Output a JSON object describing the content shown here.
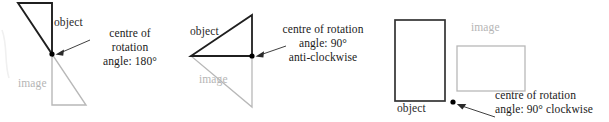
{
  "figures": [
    {
      "id": "figure-1",
      "object_label": "object",
      "image_label": "image",
      "note_lines": [
        "centre of",
        "rotation",
        "angle: 180°"
      ],
      "shape": "triangle",
      "object_color": "#111111",
      "image_color": "#b8b8b8",
      "centre_dot_color": "#000000",
      "rotation_angle": "180°",
      "rotation_direction": ""
    },
    {
      "id": "figure-2",
      "object_label": "object",
      "image_label": "image",
      "note_lines": [
        "centre of rotation",
        "angle: 90°",
        "anti-clockwise"
      ],
      "shape": "triangle",
      "object_color": "#111111",
      "image_color": "#b8b8b8",
      "centre_dot_color": "#000000",
      "rotation_angle": "90°",
      "rotation_direction": "anti-clockwise"
    },
    {
      "id": "figure-3",
      "object_label": "object",
      "image_label": "image",
      "note_lines": [
        "centre of rotation",
        "angle: 90° clockwise"
      ],
      "shape": "rectangle",
      "object_color": "#333333",
      "image_color": "#b8b8b8",
      "centre_dot_color": "#000000",
      "rotation_angle": "90°",
      "rotation_direction": "clockwise"
    }
  ],
  "colors": {
    "object_stroke": "#1f1f1f",
    "image_stroke": "#b8b8b8",
    "arrow_stroke": "#2a2a2a",
    "text": "#1a1a1a",
    "image_text": "#b5b5b5",
    "background": "#ffffff"
  }
}
